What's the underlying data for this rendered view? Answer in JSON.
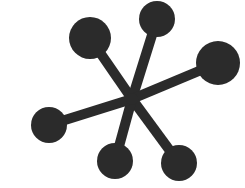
{
  "figure": {
    "background_color": "#ffffff",
    "ink_color": "#2b2b2b",
    "canvas": {
      "width": 245,
      "height": 188
    },
    "hub": {
      "x": 132,
      "y": 99,
      "radius": 6
    },
    "stroke_width": 10,
    "node_count": 6,
    "spoke_count": 6
  },
  "chart_data": {
    "type": "scatter",
    "xlabel": "",
    "ylabel": "",
    "xlim": [
      0,
      245
    ],
    "ylim": [
      0,
      188
    ],
    "grid": false,
    "legend": "none",
    "center": {
      "x": 132,
      "y": 99
    },
    "nodes": [
      {
        "name": "node-top-left",
        "x": 90,
        "y": 38,
        "r": 21,
        "angle_deg": 124,
        "length": 73
      },
      {
        "name": "node-top-center",
        "x": 157,
        "y": 19,
        "r": 18,
        "angle_deg": 73,
        "length": 84
      },
      {
        "name": "node-right",
        "x": 218,
        "y": 63,
        "r": 22,
        "angle_deg": 24,
        "length": 95
      },
      {
        "name": "node-bottom-right",
        "x": 179,
        "y": 163,
        "r": 18,
        "angle_deg": -54,
        "length": 79
      },
      {
        "name": "node-bottom-center",
        "x": 115,
        "y": 161,
        "r": 18,
        "angle_deg": -75,
        "length": 64
      },
      {
        "name": "node-left",
        "x": 49,
        "y": 125,
        "r": 18,
        "angle_deg": -160,
        "length": 87
      }
    ],
    "spokes": [
      {
        "name": "spoke-top-left",
        "x1": 132,
        "y1": 99,
        "x2": 90,
        "y2": 38
      },
      {
        "name": "spoke-top-center",
        "x1": 132,
        "y1": 99,
        "x2": 157,
        "y2": 19
      },
      {
        "name": "spoke-right",
        "x1": 132,
        "y1": 99,
        "x2": 218,
        "y2": 63
      },
      {
        "name": "spoke-bottom-right",
        "x1": 132,
        "y1": 99,
        "x2": 179,
        "y2": 163
      },
      {
        "name": "spoke-bottom-center",
        "x1": 132,
        "y1": 99,
        "x2": 115,
        "y2": 161
      },
      {
        "name": "spoke-left",
        "x1": 132,
        "y1": 99,
        "x2": 49,
        "y2": 125
      }
    ]
  }
}
